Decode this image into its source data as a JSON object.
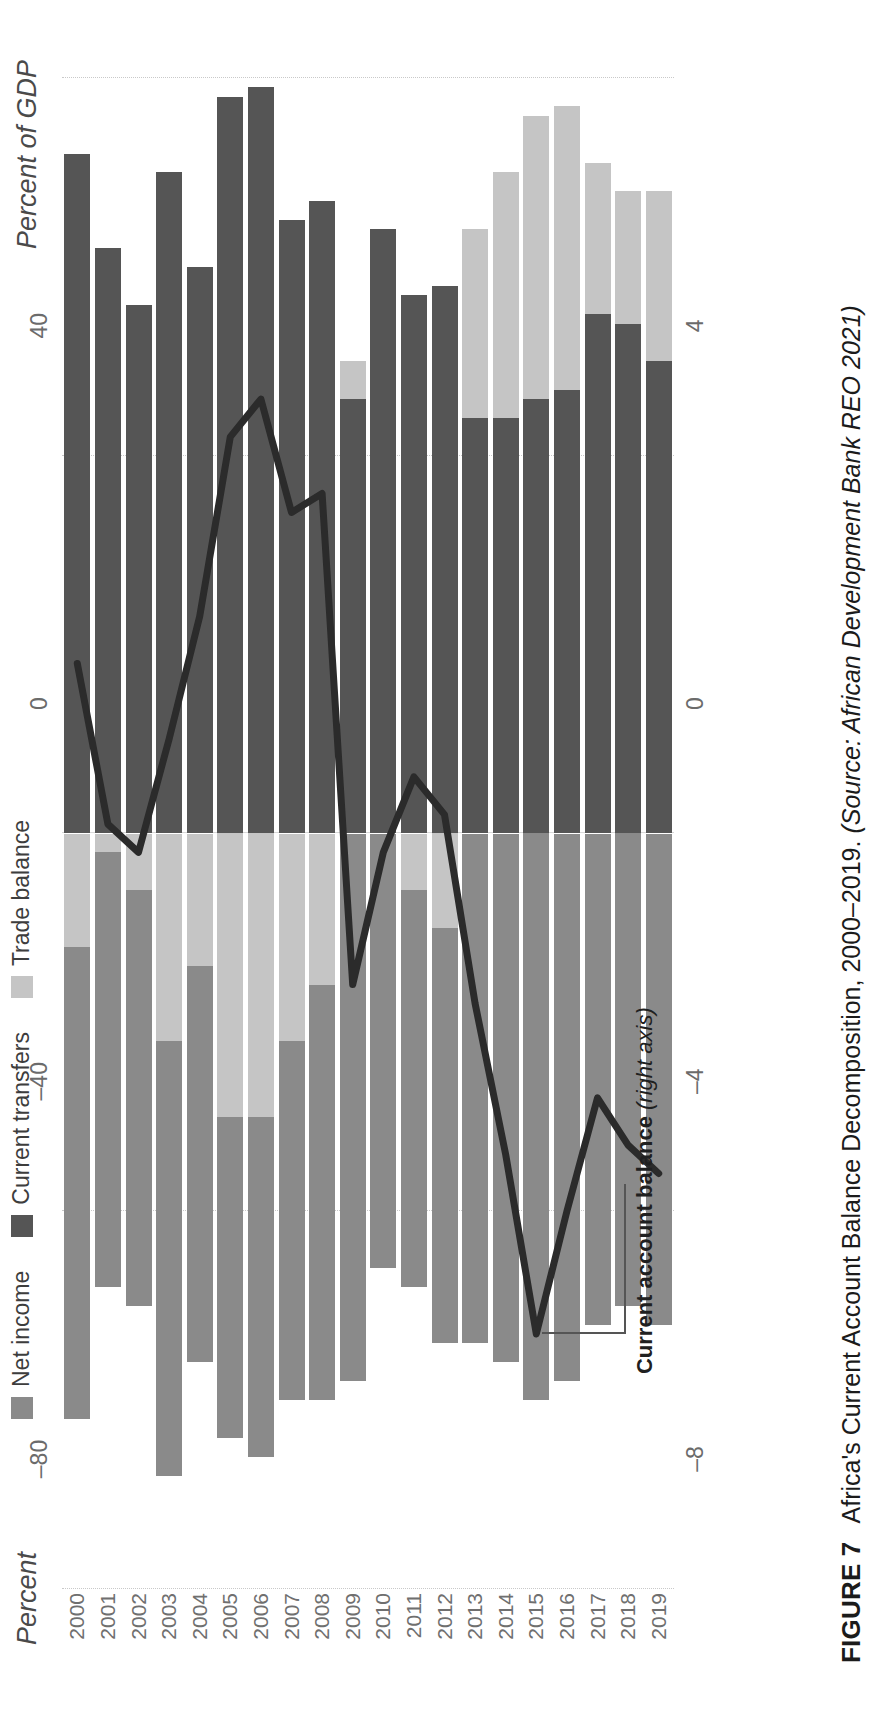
{
  "figure": {
    "label": "FIGURE 7",
    "title_main": "Africa's Current Account Balance Decomposition, 2000–2019.",
    "source": "(Source: African Development Bank REO 2021)"
  },
  "axes": {
    "left_title": "Percent",
    "right_title": "Percent of GDP",
    "left_ticks": [
      "80",
      "40",
      "0",
      "–40",
      "–80"
    ],
    "right_ticks": [
      "8",
      "4",
      "0",
      "–4",
      "–8"
    ]
  },
  "legend": {
    "items": [
      {
        "label": "Net income",
        "color": "#8a8a8a"
      },
      {
        "label": "Current transfers",
        "color": "#555555"
      },
      {
        "label": "Trade balance",
        "color": "#c5c5c5"
      }
    ]
  },
  "annotation": {
    "text_bold": "Current account balance ",
    "text_italic": "(right axis)"
  },
  "chart_data": {
    "type": "bar",
    "title": "Africa's Current Account Balance Decomposition, 2000–2019",
    "subtitle": "",
    "xlabel": "",
    "ylabel": "Percent",
    "y2label": "Percent of GDP",
    "orientation": "vertical",
    "stacked": true,
    "grid": true,
    "legend_position": "top",
    "ylim": [
      -80,
      80
    ],
    "y2lim": [
      -8,
      8
    ],
    "categories": [
      "2000",
      "2001",
      "2002",
      "2003",
      "2004",
      "2005",
      "2006",
      "2007",
      "2008",
      "2009",
      "2010",
      "2011",
      "2012",
      "2013",
      "2014",
      "2015",
      "2016",
      "2017",
      "2018",
      "2019"
    ],
    "series": [
      {
        "name": "Current transfers",
        "color": "#555555",
        "axis": "left",
        "values": [
          72,
          62,
          56,
          70,
          60,
          78,
          79,
          65,
          67,
          46,
          64,
          57,
          58,
          44,
          44,
          46,
          47,
          55,
          54,
          50
        ]
      },
      {
        "name": "Trade balance",
        "color": "#c5c5c5",
        "axis": "left",
        "values": [
          -12,
          -2,
          -6,
          -22,
          -14,
          -30,
          -30,
          -22,
          -16,
          4,
          0,
          -6,
          -10,
          20,
          26,
          30,
          30,
          16,
          14,
          18
        ]
      },
      {
        "name": "Net income",
        "color": "#8a8a8a",
        "axis": "left",
        "values": [
          -50,
          -46,
          -44,
          -46,
          -42,
          -34,
          -36,
          -38,
          -44,
          -58,
          -46,
          -42,
          -44,
          -54,
          -56,
          -60,
          -58,
          -52,
          -50,
          -52
        ]
      }
    ],
    "line_series": {
      "name": "Current account balance (right axis)",
      "color": "#2b2b2b",
      "axis": "right",
      "values": [
        1.8,
        0.1,
        -0.2,
        1.0,
        2.3,
        4.2,
        4.6,
        3.4,
        3.6,
        -1.6,
        -0.2,
        0.6,
        0.2,
        -1.8,
        -3.4,
        -5.3,
        -4.0,
        -2.8,
        -3.3,
        -3.6
      ]
    }
  }
}
